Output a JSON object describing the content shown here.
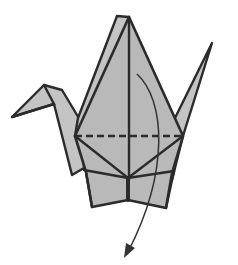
{
  "diagram": {
    "step_instruction_symbols": [
      "valley-fold-line",
      "fold-arrow"
    ],
    "colors": {
      "paper": "#b9b9b9",
      "paper_back": "#c4c4c4",
      "outline": "#2b2b2b",
      "background": "#ffffff"
    },
    "fold_line": {
      "type": "valley",
      "style": "dashed"
    },
    "arrow": {
      "direction": "down",
      "meaning": "fold front flap down along dashed line"
    }
  }
}
